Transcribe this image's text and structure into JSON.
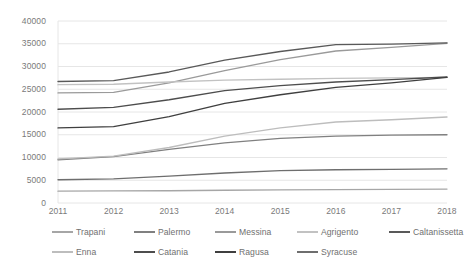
{
  "chart_data": {
    "type": "line",
    "title": "",
    "xlabel": "",
    "ylabel": "",
    "categories": [
      "2011",
      "2012",
      "2013",
      "2014",
      "2015",
      "2016",
      "2017",
      "2018"
    ],
    "x": [
      2011,
      2012,
      2013,
      2014,
      2015,
      2016,
      2017,
      2018
    ],
    "ylim": [
      0,
      40000
    ],
    "ytick_labels": [
      "40000",
      "35000",
      "30000",
      "25000",
      "20000",
      "15000",
      "10000",
      "5000",
      "0"
    ],
    "ytick_values": [
      40000,
      35000,
      30000,
      25000,
      20000,
      15000,
      10000,
      5000,
      0
    ],
    "grid": true,
    "grid_axis": "y",
    "legend_position": "bottom",
    "series": [
      {
        "name": "Trapani",
        "color": "#a6a6a6",
        "values": [
          2600,
          2650,
          2700,
          2800,
          2900,
          2950,
          3000,
          3050
        ]
      },
      {
        "name": "Palermo",
        "color": "#808080",
        "values": [
          9500,
          10200,
          11800,
          13200,
          14200,
          14700,
          14900,
          15000
        ]
      },
      {
        "name": "Messina",
        "color": "#9a9a9a",
        "values": [
          24200,
          24300,
          26400,
          29100,
          31500,
          33400,
          34200,
          35100
        ]
      },
      {
        "name": "Agrigento",
        "color": "#c2c2c2",
        "values": [
          26000,
          26100,
          26600,
          27000,
          27200,
          27400,
          27500,
          27600
        ]
      },
      {
        "name": "Caltanissetta",
        "color": "#595959",
        "values": [
          26700,
          26900,
          28800,
          31400,
          33300,
          34800,
          34900,
          35200
        ]
      },
      {
        "name": "Enna",
        "color": "#bdbdbd",
        "values": [
          9700,
          10300,
          12200,
          14700,
          16500,
          17800,
          18300,
          18900
        ]
      },
      {
        "name": "Catania",
        "color": "#4d4d4d",
        "values": [
          20600,
          21000,
          22700,
          24700,
          25800,
          26600,
          27100,
          27700
        ]
      },
      {
        "name": "Ragusa",
        "color": "#3f3f3f",
        "values": [
          16500,
          16800,
          19000,
          21900,
          23800,
          25400,
          26400,
          27600
        ]
      },
      {
        "name": "Syracuse",
        "color": "#6e6e6e",
        "values": [
          5100,
          5300,
          5900,
          6600,
          7100,
          7300,
          7400,
          7500
        ]
      }
    ]
  },
  "legend": {
    "rows": [
      [
        {
          "label": "Trapani",
          "color": "#a6a6a6"
        },
        {
          "label": "Palermo",
          "color": "#808080"
        },
        {
          "label": "Messina",
          "color": "#9a9a9a"
        },
        {
          "label": "Agrigento",
          "color": "#c2c2c2"
        },
        {
          "label": "Caltanissetta",
          "color": "#595959"
        }
      ],
      [
        {
          "label": "Enna",
          "color": "#bdbdbd"
        },
        {
          "label": "Catania",
          "color": "#4d4d4d"
        },
        {
          "label": "Ragusa",
          "color": "#3f3f3f"
        },
        {
          "label": "Syracuse",
          "color": "#6e6e6e"
        }
      ]
    ]
  },
  "axes": {
    "gridline_color": "#e6e6e6",
    "tick_label_color": "#7a7a7a"
  }
}
